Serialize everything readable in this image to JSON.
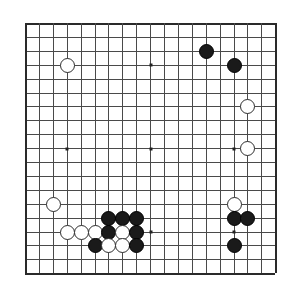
{
  "app": {
    "title": "Go Board",
    "kind": "go-board-diagram"
  },
  "board": {
    "size": 19,
    "columns": 19,
    "rows": 19,
    "cell_px": 13.9,
    "origin_x_px": 8,
    "origin_y_px": 7,
    "line_color": "#4a4a4a",
    "edge_color": "#2a2a2a",
    "background_color": "#ffffff",
    "black_color": "#1a1a1a",
    "white_color": "#ffffff",
    "white_border_color": "#2d2d2d",
    "stone_diameter_px": 15,
    "star_points": [
      {
        "col": 4,
        "row": 4
      },
      {
        "col": 10,
        "row": 4
      },
      {
        "col": 16,
        "row": 4
      },
      {
        "col": 4,
        "row": 10
      },
      {
        "col": 10,
        "row": 10
      },
      {
        "col": 16,
        "row": 10
      },
      {
        "col": 4,
        "row": 16
      },
      {
        "col": 10,
        "row": 16
      },
      {
        "col": 16,
        "row": 16
      }
    ]
  },
  "stones": [
    {
      "color": "black",
      "col": 14,
      "row": 3,
      "label": "black-stone-14-3"
    },
    {
      "color": "black",
      "col": 16,
      "row": 4,
      "label": "black-stone-16-4"
    },
    {
      "color": "white",
      "col": 4,
      "row": 4,
      "label": "white-stone-4-4"
    },
    {
      "color": "white",
      "col": 17,
      "row": 7,
      "label": "white-stone-17-7"
    },
    {
      "color": "white",
      "col": 17,
      "row": 10,
      "label": "white-stone-17-10"
    },
    {
      "color": "white",
      "col": 3,
      "row": 14,
      "label": "white-stone-3-14"
    },
    {
      "color": "white",
      "col": 16,
      "row": 14,
      "label": "white-stone-16-14"
    },
    {
      "color": "black",
      "col": 7,
      "row": 15,
      "label": "black-stone-7-15"
    },
    {
      "color": "black",
      "col": 8,
      "row": 15,
      "label": "black-stone-8-15"
    },
    {
      "color": "black",
      "col": 9,
      "row": 15,
      "label": "black-stone-9-15"
    },
    {
      "color": "black",
      "col": 16,
      "row": 15,
      "label": "black-stone-16-15"
    },
    {
      "color": "black",
      "col": 17,
      "row": 15,
      "label": "black-stone-17-15"
    },
    {
      "color": "white",
      "col": 4,
      "row": 16,
      "label": "white-stone-4-16"
    },
    {
      "color": "white",
      "col": 5,
      "row": 16,
      "label": "white-stone-5-16"
    },
    {
      "color": "white",
      "col": 6,
      "row": 16,
      "label": "white-stone-6-16"
    },
    {
      "color": "black",
      "col": 7,
      "row": 16,
      "label": "black-stone-7-16"
    },
    {
      "color": "white",
      "col": 8,
      "row": 16,
      "label": "white-stone-8-16"
    },
    {
      "color": "black",
      "col": 9,
      "row": 16,
      "label": "black-stone-9-16"
    },
    {
      "color": "black",
      "col": 6,
      "row": 17,
      "label": "black-stone-6-17"
    },
    {
      "color": "white",
      "col": 7,
      "row": 17,
      "label": "white-stone-7-17"
    },
    {
      "color": "white",
      "col": 8,
      "row": 17,
      "label": "white-stone-8-17"
    },
    {
      "color": "black",
      "col": 9,
      "row": 17,
      "label": "black-stone-9-17"
    },
    {
      "color": "black",
      "col": 16,
      "row": 17,
      "label": "black-stone-16-17"
    }
  ]
}
